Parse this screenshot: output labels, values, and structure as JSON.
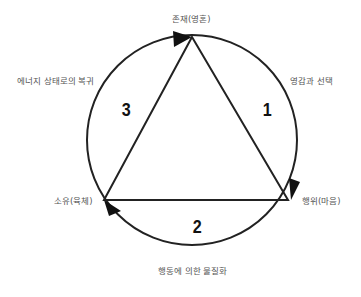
{
  "diagram": {
    "nodes": {
      "top": "존재(영혼)",
      "right": "행위(마음)",
      "left": "소유(육체)"
    },
    "arcs": {
      "right": "영감과 선택",
      "bottom": "행동에 의한 물질화",
      "left": "에너지 상태로의 복귀"
    },
    "numbers": {
      "one": "1",
      "two": "2",
      "three": "3"
    },
    "colors": {
      "stroke": "#222222",
      "text": "#555555"
    }
  }
}
